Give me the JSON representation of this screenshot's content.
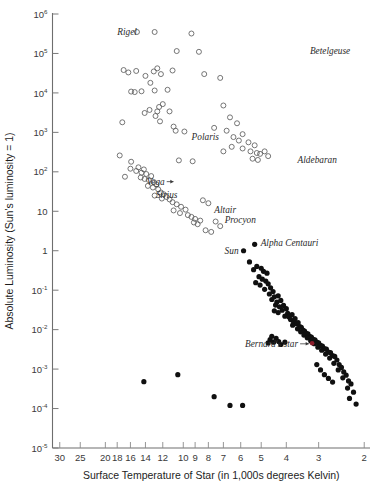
{
  "figure": {
    "background": "#ffffff",
    "axis_color": "#6e6e6e",
    "open_marker_color": "#5d5d5d",
    "filled_marker_color": "#101010",
    "highlight_color": "#8c1c2b"
  },
  "chart_data": {
    "type": "scatter",
    "title": "",
    "xlabel": "Surface Temperature of Star (in 1,000s degrees Kelvin)",
    "ylabel": "Absolute Luminosity (Sun's luminosity = 1)",
    "xscale": "log-reversed",
    "yscale": "log",
    "xlim": [
      32,
      1.9
    ],
    "ylim": [
      1e-05,
      1000000.0
    ],
    "grid": false,
    "legend": null,
    "xticks": [
      {
        "value": 30,
        "label": "30"
      },
      {
        "value": 25,
        "label": "25"
      },
      {
        "value": 20,
        "label": "20"
      },
      {
        "value": 18,
        "label": "18"
      },
      {
        "value": 16,
        "label": "16"
      },
      {
        "value": 14,
        "label": "14"
      },
      {
        "value": 12,
        "label": "12"
      },
      {
        "value": 10,
        "label": "10"
      },
      {
        "value": 9,
        "label": "9"
      },
      {
        "value": 8,
        "label": "8"
      },
      {
        "value": 7,
        "label": "7"
      },
      {
        "value": 6,
        "label": "6"
      },
      {
        "value": 5,
        "label": "5"
      },
      {
        "value": 4,
        "label": "4"
      },
      {
        "value": 3,
        "label": "3"
      },
      {
        "value": 2,
        "label": "2"
      }
    ],
    "yticks": [
      {
        "value": 1000000,
        "base": "10",
        "exp": "6"
      },
      {
        "value": 100000,
        "base": "10",
        "exp": "5"
      },
      {
        "value": 10000,
        "base": "10",
        "exp": "4"
      },
      {
        "value": 1000,
        "base": "10",
        "exp": "3"
      },
      {
        "value": 100,
        "base": "10",
        "exp": "2"
      },
      {
        "value": 10,
        "base": "10",
        "exp": ""
      },
      {
        "value": 1,
        "base": "1",
        "exp": ""
      },
      {
        "value": 0.1,
        "base": "10",
        "exp": "-1"
      },
      {
        "value": 0.01,
        "base": "10",
        "exp": "-2"
      },
      {
        "value": 0.001,
        "base": "10",
        "exp": "-3"
      },
      {
        "value": 0.0001,
        "base": "10",
        "exp": "-4"
      },
      {
        "value": 1e-05,
        "base": "10",
        "exp": "-5"
      }
    ],
    "series": [
      {
        "name": "giants-and-supergiants",
        "marker": "open-circle",
        "points": [
          [
            15.1,
            350000
          ],
          [
            12.9,
            350000
          ],
          [
            9.3,
            320000
          ],
          [
            10.6,
            115000
          ],
          [
            8.7,
            110000
          ],
          [
            17.0,
            38000
          ],
          [
            16.3,
            33000
          ],
          [
            15.2,
            36000
          ],
          [
            14.0,
            27000
          ],
          [
            13.0,
            35000
          ],
          [
            12.6,
            42000
          ],
          [
            12.2,
            30000
          ],
          [
            13.4,
            18000
          ],
          [
            14.5,
            11000
          ],
          [
            15.4,
            10500
          ],
          [
            15.9,
            10800
          ],
          [
            12.9,
            11500
          ],
          [
            11.5,
            12000
          ],
          [
            11.0,
            37000
          ],
          [
            8.3,
            30000
          ],
          [
            7.2,
            24000
          ],
          [
            14.1,
            3100
          ],
          [
            17.2,
            1800
          ],
          [
            13.5,
            3700
          ],
          [
            12.0,
            5200
          ],
          [
            12.4,
            4400
          ],
          [
            12.6,
            3400
          ],
          [
            12.8,
            2600
          ],
          [
            12.3,
            1900
          ],
          [
            11.3,
            3400
          ],
          [
            10.9,
            1400
          ],
          [
            10.7,
            1100
          ],
          [
            9.9,
            1050
          ],
          [
            10.4,
            195
          ],
          [
            9.2,
            185
          ],
          [
            7.6,
            1300
          ],
          [
            7.0,
            4800
          ],
          [
            6.6,
            2400
          ],
          [
            6.2,
            1700
          ],
          [
            6.8,
            1100
          ],
          [
            6.4,
            760
          ],
          [
            5.9,
            900
          ],
          [
            6.1,
            620
          ],
          [
            5.6,
            560
          ],
          [
            5.3,
            470
          ],
          [
            5.9,
            390
          ],
          [
            5.5,
            330
          ],
          [
            5.2,
            300
          ],
          [
            5.05,
            285
          ],
          [
            5.4,
            215
          ],
          [
            5.15,
            200
          ],
          [
            4.85,
            330
          ],
          [
            4.7,
            250
          ],
          [
            6.5,
            430
          ],
          [
            7.0,
            330
          ],
          [
            16.0,
            120
          ],
          [
            15.2,
            105
          ],
          [
            14.9,
            130
          ],
          [
            14.5,
            95
          ],
          [
            14.2,
            115
          ],
          [
            13.9,
            88
          ],
          [
            14.6,
            72
          ],
          [
            14.1,
            66
          ],
          [
            13.6,
            62
          ],
          [
            13.3,
            78
          ],
          [
            13.0,
            55
          ],
          [
            12.7,
            48
          ],
          [
            13.7,
            44
          ],
          [
            13.1,
            40
          ],
          [
            12.5,
            36
          ],
          [
            12.2,
            30
          ],
          [
            11.9,
            27
          ],
          [
            11.6,
            23
          ],
          [
            11.3,
            20
          ],
          [
            12.9,
            25
          ],
          [
            12.1,
            21
          ],
          [
            11.0,
            17
          ],
          [
            10.6,
            15
          ],
          [
            10.2,
            13
          ],
          [
            9.8,
            11
          ],
          [
            10.9,
            10.5
          ],
          [
            10.3,
            9.0
          ],
          [
            9.6,
            8.0
          ],
          [
            9.3,
            7.2
          ],
          [
            9.0,
            6.4
          ],
          [
            8.6,
            5.8
          ],
          [
            9.1,
            5.2
          ],
          [
            8.8,
            4.7
          ],
          [
            8.4,
            19
          ],
          [
            8.0,
            16
          ],
          [
            15.9,
            180
          ],
          [
            17.6,
            260
          ],
          [
            16.8,
            75
          ],
          [
            7.5,
            5.5
          ],
          [
            7.2,
            4.2
          ],
          [
            8.2,
            3.3
          ],
          [
            7.8,
            3.0
          ]
        ]
      },
      {
        "name": "main-sequence-and-dwarfs",
        "marker": "filled-circle",
        "points": [
          [
            5.85,
            1.0
          ],
          [
            5.3,
            1.45
          ],
          [
            5.55,
            0.52
          ],
          [
            5.2,
            0.4
          ],
          [
            5.35,
            0.33
          ],
          [
            5.0,
            0.36
          ],
          [
            4.9,
            0.3
          ],
          [
            4.75,
            0.27
          ],
          [
            5.1,
            0.22
          ],
          [
            4.95,
            0.19
          ],
          [
            4.8,
            0.17
          ],
          [
            5.25,
            0.155
          ],
          [
            5.05,
            0.135
          ],
          [
            4.7,
            0.145
          ],
          [
            4.85,
            0.105
          ],
          [
            4.6,
            0.115
          ],
          [
            4.5,
            0.092
          ],
          [
            4.65,
            0.08
          ],
          [
            4.45,
            0.068
          ],
          [
            4.3,
            0.072
          ],
          [
            4.55,
            0.058
          ],
          [
            4.35,
            0.05
          ],
          [
            4.2,
            0.055
          ],
          [
            4.4,
            0.042
          ],
          [
            4.25,
            0.038
          ],
          [
            4.1,
            0.041
          ],
          [
            4.45,
            0.03
          ],
          [
            4.3,
            0.027
          ],
          [
            4.15,
            0.031
          ],
          [
            4.0,
            0.034
          ],
          [
            3.95,
            0.026
          ],
          [
            4.05,
            0.022
          ],
          [
            3.9,
            0.021
          ],
          [
            3.8,
            0.024
          ],
          [
            3.85,
            0.018
          ],
          [
            3.75,
            0.016
          ],
          [
            3.7,
            0.019
          ],
          [
            3.65,
            0.014
          ],
          [
            3.78,
            0.013
          ],
          [
            3.6,
            0.015
          ],
          [
            3.55,
            0.012
          ],
          [
            3.62,
            0.0105
          ],
          [
            3.5,
            0.0115
          ],
          [
            3.45,
            0.0098
          ],
          [
            3.52,
            0.0088
          ],
          [
            3.4,
            0.0092
          ],
          [
            3.35,
            0.008
          ],
          [
            3.42,
            0.0073
          ],
          [
            3.3,
            0.0078
          ],
          [
            3.25,
            0.0068
          ],
          [
            3.32,
            0.0062
          ],
          [
            3.2,
            0.0065
          ],
          [
            3.15,
            0.0057
          ],
          [
            3.22,
            0.0052
          ],
          [
            3.1,
            0.0055
          ],
          [
            3.05,
            0.0048
          ],
          [
            3.12,
            0.0044
          ],
          [
            3.0,
            0.0046
          ],
          [
            2.95,
            0.004
          ],
          [
            3.02,
            0.0036
          ],
          [
            2.9,
            0.0038
          ],
          [
            2.85,
            0.0033
          ],
          [
            2.92,
            0.003
          ],
          [
            2.8,
            0.0032
          ],
          [
            2.75,
            0.0027
          ],
          [
            2.82,
            0.0024
          ],
          [
            2.7,
            0.0026
          ],
          [
            2.65,
            0.0022
          ],
          [
            2.72,
            0.0019
          ],
          [
            2.6,
            0.0021
          ],
          [
            2.55,
            0.0017
          ],
          [
            2.62,
            0.0014
          ],
          [
            2.5,
            0.0013
          ],
          [
            2.45,
            0.0011
          ],
          [
            2.52,
            0.00095
          ],
          [
            2.4,
            0.00085
          ],
          [
            2.35,
            0.0007
          ],
          [
            2.42,
            0.0006
          ],
          [
            2.3,
            0.0005
          ],
          [
            2.25,
            0.00042
          ],
          [
            2.32,
            0.00033
          ],
          [
            2.2,
            0.00026
          ],
          [
            2.28,
            0.00018
          ],
          [
            2.15,
            0.00013
          ],
          [
            2.95,
            0.00095
          ],
          [
            2.85,
            0.00072
          ],
          [
            2.75,
            0.00058
          ],
          [
            2.65,
            0.00047
          ],
          [
            3.05,
            0.0013
          ],
          [
            14.2,
            0.00048
          ],
          [
            10.5,
            0.00072
          ],
          [
            7.6,
            0.0002
          ],
          [
            6.6,
            0.00012
          ],
          [
            5.9,
            0.00012
          ],
          [
            4.55,
            0.0068
          ],
          [
            4.62,
            0.0056
          ],
          [
            4.38,
            0.006
          ],
          [
            4.48,
            0.0048
          ],
          [
            4.28,
            0.005
          ],
          [
            4.7,
            0.0046
          ],
          [
            4.2,
            0.0042
          ],
          [
            4.05,
            0.0048
          ]
        ]
      },
      {
        "name": "bernards-star",
        "marker": "highlight-circle",
        "points": [
          [
            3.18,
            0.0045
          ]
        ]
      }
    ],
    "annotations": [
      {
        "label": "Rigel",
        "x": 14.2,
        "y": 350000,
        "anchor": "end",
        "dx": -7,
        "dy": 3.5,
        "leader": false
      },
      {
        "label": "Betelgeuse",
        "x": 3.45,
        "y": 120000,
        "anchor": "start",
        "dx": 7,
        "dy": 3.5,
        "leader": false
      },
      {
        "label": "Polaris",
        "x": 6.9,
        "y": 780,
        "anchor": "end",
        "dx": -6,
        "dy": 3.5,
        "leader": false
      },
      {
        "label": "Aldebaran",
        "x": 3.85,
        "y": 210,
        "anchor": "start",
        "dx": 7,
        "dy": 3.5,
        "leader": false
      },
      {
        "label": "Vega",
        "x": 10.6,
        "y": 58,
        "anchor": "end",
        "dx": -12,
        "dy": 3.5,
        "leader": true
      },
      {
        "label": "Sirius",
        "x": 9.9,
        "y": 26,
        "anchor": "end",
        "dx": -7,
        "dy": 3.5,
        "leader": false
      },
      {
        "label": "Altair",
        "x": 8.0,
        "y": 10.2,
        "anchor": "start",
        "dx": 6,
        "dy": 2.0,
        "leader": false
      },
      {
        "label": "Procyon",
        "x": 7.3,
        "y": 6.4,
        "anchor": "start",
        "dx": 6,
        "dy": 4.5,
        "leader": false
      },
      {
        "label": "Sun",
        "x": 5.85,
        "y": 1.0,
        "anchor": "end",
        "dx": -5,
        "dy": 3.5,
        "leader": false
      },
      {
        "label": "Alpha Centauri",
        "x": 5.3,
        "y": 1.45,
        "anchor": "start",
        "dx": 6,
        "dy": 2.0,
        "leader": false
      },
      {
        "label": "Bernard's star",
        "x": 3.18,
        "y": 0.0045,
        "anchor": "end",
        "dx": -14,
        "dy": 3.5,
        "leader": true
      }
    ]
  }
}
